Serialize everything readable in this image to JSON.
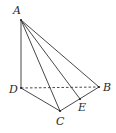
{
  "diagram": {
    "type": "geometry-pyramid",
    "colors": {
      "line": "#333333",
      "label": "#2a2a2a",
      "background": "#ffffff"
    },
    "points": [
      {
        "id": "A",
        "label": "A",
        "x": 21,
        "y": 20,
        "lx": 13,
        "ly": 14
      },
      {
        "id": "D",
        "label": "D",
        "x": 21,
        "y": 88,
        "lx": 9,
        "ly": 93
      },
      {
        "id": "C",
        "label": "C",
        "x": 60,
        "y": 111,
        "lx": 56,
        "ly": 125
      },
      {
        "id": "B",
        "label": "B",
        "x": 99,
        "y": 87,
        "lx": 103,
        "ly": 91
      },
      {
        "id": "E",
        "label": "E",
        "x": 80,
        "y": 99,
        "lx": 78,
        "ly": 111
      }
    ],
    "edges": [
      {
        "from": "A",
        "to": "D",
        "style": "solid"
      },
      {
        "from": "A",
        "to": "C",
        "style": "solid"
      },
      {
        "from": "A",
        "to": "E",
        "style": "solid"
      },
      {
        "from": "A",
        "to": "B",
        "style": "solid"
      },
      {
        "from": "D",
        "to": "C",
        "style": "solid"
      },
      {
        "from": "C",
        "to": "B",
        "style": "solid"
      },
      {
        "from": "D",
        "to": "B",
        "style": "dashed"
      }
    ]
  }
}
